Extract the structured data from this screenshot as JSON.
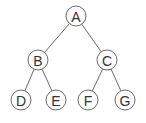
{
  "diagram": {
    "type": "binary-tree",
    "nodes": [
      {
        "id": "A",
        "label": "A",
        "cx": 76,
        "cy": 16
      },
      {
        "id": "B",
        "label": "B",
        "cx": 38,
        "cy": 60
      },
      {
        "id": "C",
        "label": "C",
        "cx": 107,
        "cy": 60
      },
      {
        "id": "D",
        "label": "D",
        "cx": 21,
        "cy": 100
      },
      {
        "id": "E",
        "label": "E",
        "cx": 56,
        "cy": 100
      },
      {
        "id": "F",
        "label": "F",
        "cx": 88,
        "cy": 100
      },
      {
        "id": "G",
        "label": "G",
        "cx": 125,
        "cy": 100
      }
    ],
    "edges": [
      [
        "A",
        "B"
      ],
      [
        "A",
        "C"
      ],
      [
        "B",
        "D"
      ],
      [
        "B",
        "E"
      ],
      [
        "C",
        "F"
      ],
      [
        "C",
        "G"
      ]
    ],
    "node_radius": 10,
    "colors": {
      "stroke": "#6a6a6a",
      "text": "#333333",
      "fill": "#ffffff"
    }
  }
}
